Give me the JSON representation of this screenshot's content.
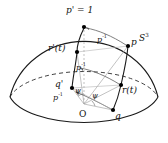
{
  "figure": {
    "kind": "geometric-diagram",
    "title_label": "p' = 1",
    "surface_label": "S",
    "surface_superscript": "3",
    "origin_label": "O",
    "background_color": "#ffffff",
    "stroke_color": "#1a1a1a",
    "faint_stroke_color": "#9a9a9a",
    "point_color": "#000000",
    "labels": {
      "apex": "p' = 1",
      "curve_left": "r'(t)",
      "curve_right": "r(t)",
      "point_p": "p",
      "point_q": "q",
      "point_q_prime": "q'",
      "map_top": "p",
      "map_top_exp": "-1",
      "map_mid": "p",
      "map_mid_exp": "-1",
      "map_bottom": "p",
      "map_bottom_exp": "-1",
      "angle_upper": "ψ",
      "angle_lower": "ψ",
      "origin": "O",
      "sphere": "S",
      "sphere_exp": "3"
    },
    "points": [
      {
        "name": "apex",
        "label": "p' = 1",
        "x": 84,
        "y": 27
      },
      {
        "name": "p",
        "label": "p",
        "x": 128,
        "y": 46
      },
      {
        "name": "r-prime-t",
        "label": "r'(t)",
        "x": 77,
        "y": 52
      },
      {
        "name": "r-t",
        "label": "r(t)",
        "x": 121,
        "y": 85
      },
      {
        "name": "q-prime",
        "label": "q'",
        "x": 72,
        "y": 88
      },
      {
        "name": "q",
        "label": "q",
        "x": 113,
        "y": 110
      },
      {
        "name": "origin",
        "label": "O",
        "x": 82,
        "y": 108
      }
    ],
    "annotations": [
      {
        "name": "arrow-top",
        "label": "p",
        "exp": "-1"
      },
      {
        "name": "arrow-mid",
        "label": "p",
        "exp": "-1"
      },
      {
        "name": "arrow-bottom",
        "label": "p",
        "exp": "-1"
      }
    ]
  }
}
